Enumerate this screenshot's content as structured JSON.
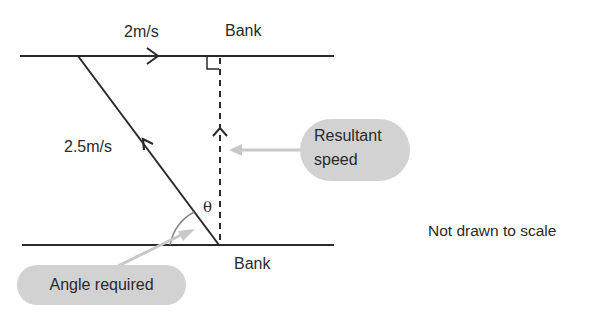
{
  "diagram": {
    "labels": {
      "river_speed": "2m/s",
      "top_bank": "Bank",
      "bottom_bank": "Bank",
      "boat_speed": "2.5m/s",
      "angle_symbol": "θ"
    },
    "callouts": {
      "resultant_line1": "Resultant",
      "resultant_line2": "speed",
      "angle_required": "Angle required"
    },
    "note": "Not drawn to scale",
    "colors": {
      "line": "#2a2a2a",
      "callout_fill": "#d2d2d2",
      "callout_arrow": "#c8c8c8"
    }
  }
}
